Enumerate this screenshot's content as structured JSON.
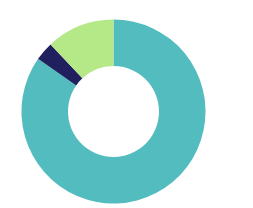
{
  "chart_data": {
    "type": "pie",
    "variant": "donut",
    "title": "",
    "subtitle": "",
    "xlabel": "",
    "ylabel": "",
    "grid": false,
    "legend": "none",
    "labels_shown": false,
    "categories": [
      "Segment 1",
      "Segment 2",
      "Segment 3"
    ],
    "values": [
      84.7,
      3.3,
      12.0
    ],
    "unit": "%",
    "colors": [
      "#53bcbf",
      "#20205f",
      "#b5e887"
    ],
    "series": [
      {
        "name": "Share",
        "values": [
          84.7,
          3.3,
          12.0
        ]
      }
    ],
    "slices": [
      {
        "label": "Segment 1",
        "value": 84.7,
        "color": "#53bcbf",
        "start_angle_deg": 0,
        "end_angle_deg": 304.9
      },
      {
        "label": "Segment 2",
        "value": 3.3,
        "color": "#20205f",
        "start_angle_deg": 304.9,
        "end_angle_deg": 316.8
      },
      {
        "label": "Segment 3",
        "value": 12.0,
        "color": "#b5e887",
        "start_angle_deg": 316.8,
        "end_angle_deg": 360
      }
    ],
    "geometry": {
      "center_x": 113.5,
      "center_y": 111.5,
      "outer_radius": 92,
      "inner_radius": 45.5,
      "hole_ratio": 0.49,
      "start_angle_deg": 0,
      "direction": "clockwise"
    },
    "background_color": "#ffffff"
  }
}
